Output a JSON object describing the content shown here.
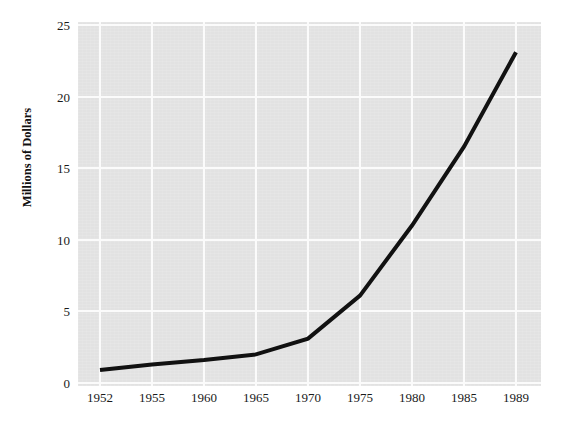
{
  "chart_data": {
    "type": "line",
    "title": "",
    "subtitle": "",
    "xlabel": "",
    "ylabel": "Millions of Dollars",
    "categories": [
      "1952",
      "1955",
      "1960",
      "1965",
      "1970",
      "1975",
      "1980",
      "1985",
      "1989"
    ],
    "values": [
      0.9,
      1.3,
      1.6,
      2.0,
      3.1,
      6.1,
      11.0,
      16.5,
      23.1
    ],
    "series": [
      {
        "name": "",
        "values": [
          0.9,
          1.3,
          1.6,
          2.0,
          3.1,
          6.1,
          11.0,
          16.5,
          23.1
        ]
      }
    ],
    "ylim": [
      0,
      25
    ],
    "yticks": [
      0,
      5,
      10,
      15,
      20,
      25
    ],
    "ytick_labels": [
      "0",
      "5",
      "10",
      "15",
      "20",
      "25"
    ],
    "xtick_labels": [
      "1952",
      "1955",
      "1960",
      "1965",
      "1970",
      "1975",
      "1980",
      "1985",
      "1989"
    ],
    "grid": true,
    "gridlines": "both",
    "legend": "none",
    "annotations": [],
    "colors": {
      "line": "#111111",
      "plot_background": "#e2e2e2",
      "gridline": "#fbfbfb",
      "figure_background": "#ffffff",
      "text": "#1a1a1a"
    },
    "line_width_px": 4
  },
  "axes": {
    "y_title": "Millions of Dollars",
    "y_ticks": [
      {
        "label": "25",
        "value": 25
      },
      {
        "label": "20",
        "value": 20
      },
      {
        "label": "15",
        "value": 15
      },
      {
        "label": "10",
        "value": 10
      },
      {
        "label": "5",
        "value": 5
      },
      {
        "label": "0",
        "value": 0
      }
    ],
    "x_ticks": [
      {
        "label": "1952"
      },
      {
        "label": "1955"
      },
      {
        "label": "1960"
      },
      {
        "label": "1965"
      },
      {
        "label": "1970"
      },
      {
        "label": "1975"
      },
      {
        "label": "1980"
      },
      {
        "label": "1985"
      },
      {
        "label": "1989"
      }
    ]
  }
}
